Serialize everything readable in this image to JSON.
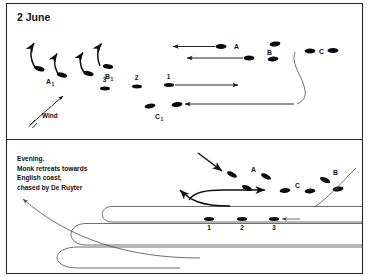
{
  "figure": {
    "title_top": "2 June",
    "caption_bottom": [
      "Evening.",
      "Monk retreats towards",
      "English coast,",
      "chased by De Ruyter"
    ],
    "wind_label": "Wind",
    "colors": {
      "ship": "#0a0a0a",
      "track": "#4a4a4a",
      "arrow": "#111111",
      "frame": "#2b2b2b",
      "background": "#ffffff"
    }
  },
  "panels": [
    {
      "id": "top",
      "title": "2 June",
      "fleet_labels": [
        "A",
        "B",
        "C"
      ],
      "detached_labels": [
        "A₁",
        "B₁",
        "C₁"
      ],
      "squadron_numbers": [
        "3",
        "2",
        "1"
      ],
      "number_position": "above",
      "wind_label": "Wind",
      "wind_direction": "from south-west (arrow points up-right)"
    },
    {
      "id": "bottom",
      "caption": "Evening. Monk retreats towards English coast, chased by De Ruyter",
      "fleet_labels": [
        "A",
        "B",
        "C"
      ],
      "squadron_numbers": [
        "1",
        "2",
        "3"
      ],
      "number_position": "below"
    }
  ],
  "labels": {
    "title": "2 June",
    "A": "A",
    "B": "B",
    "C": "C",
    "A1_base": "A",
    "A1_sub": "1",
    "B1_base": "B",
    "B1_sub": "1",
    "C1_base": "C",
    "C1_sub": "1",
    "n1": "1",
    "n2": "2",
    "n3": "3",
    "b1": "1",
    "b2": "2",
    "b3": "3",
    "wind": "Wind",
    "cap1": "Evening.",
    "cap2": "Monk retreats towards",
    "cap3": "English coast,",
    "cap4": "chased by De Ruyter"
  }
}
